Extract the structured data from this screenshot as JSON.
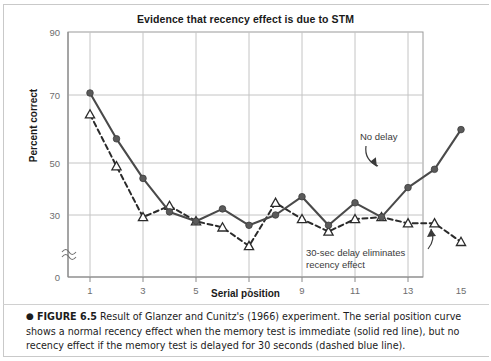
{
  "figure": {
    "title": "Evidence that recency effect is due to STM",
    "caption_bullet": "●",
    "caption_label": "FIGURE 6.5",
    "caption_text": "Result of Glanzer and Cunitz's (1966) experiment. The serial position curve shows a normal recency effect when the memory test is immediate (solid red line), but no recency effect if the memory test is delayed for 30 seconds (dashed blue line)."
  },
  "annotations": {
    "no_delay": "No delay",
    "delay": "30-sec delay eliminates recency effect"
  },
  "colors": {
    "line_solid": "#4a4a4a",
    "line_dashed": "#2b2b2b",
    "grid": "#c4c4c4",
    "axis": "#8a8a8a",
    "text": "#1a1a1a",
    "tick_text": "#6e6e6e",
    "annotation_text": "#3a3a3a",
    "marker_fill": "#5a5a5a",
    "marker_open": "#ffffff"
  },
  "chart_data": {
    "type": "line",
    "title": "Evidence that recency effect is due to STM",
    "xlabel": "Serial position",
    "ylabel": "Percent correct",
    "x": [
      1,
      2,
      3,
      4,
      5,
      6,
      7,
      8,
      9,
      10,
      11,
      12,
      13,
      14,
      15
    ],
    "xtick_labels": [
      "1",
      "3",
      "5",
      "7",
      "9",
      "11",
      "13",
      "15"
    ],
    "xtick_values": [
      1,
      3,
      5,
      7,
      9,
      11,
      13,
      15
    ],
    "xlim": [
      0.4,
      15.6
    ],
    "ytick_labels": [
      "0",
      "30",
      "50",
      "70",
      "90"
    ],
    "ytick_values": [
      0,
      30,
      50,
      70,
      90
    ],
    "ylim": [
      0,
      90
    ],
    "y_axis_break": true,
    "y_axis_break_between": [
      0,
      30
    ],
    "grid": true,
    "legend": "annotations",
    "series": [
      {
        "name": "No delay",
        "style": "solid",
        "marker": "filled-circle",
        "values": [
          70,
          55,
          42,
          31,
          27,
          32,
          25,
          30,
          36,
          25,
          34,
          29,
          39,
          45,
          58
        ]
      },
      {
        "name": "30-sec delay eliminates recency effect",
        "style": "dashed",
        "marker": "open-triangle",
        "values": [
          63,
          46,
          29,
          33,
          27,
          24,
          15,
          34,
          28,
          22,
          28,
          29,
          26,
          26,
          17
        ]
      }
    ]
  },
  "axes": {
    "y_label": "Percent correct",
    "x_label": "Serial position"
  }
}
